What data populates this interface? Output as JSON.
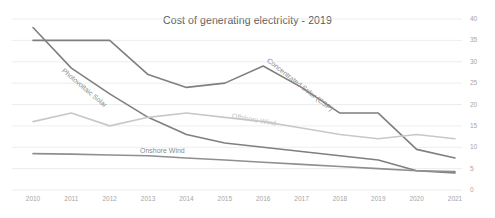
{
  "chart_data": {
    "type": "line",
    "title": "Cost of generating electricity - 2019",
    "xlabel": "",
    "ylabel": "",
    "ylim": [
      0,
      40
    ],
    "yticks": [
      0,
      5,
      10,
      15,
      20,
      25,
      30,
      35,
      40
    ],
    "grid": true,
    "legend_position": "inline-labels",
    "categories": [
      "2010",
      "2011",
      "2012",
      "2013",
      "2014",
      "2015",
      "2016",
      "2017",
      "2018",
      "2019",
      "2020",
      "2021"
    ],
    "series": [
      {
        "name": "Photovoltaic Solar",
        "color": "#7f7f7f",
        "values": [
          38.0,
          28.5,
          22.5,
          17.0,
          13.0,
          11.0,
          10.0,
          9.0,
          8.0,
          7.0,
          4.5,
          4.0
        ]
      },
      {
        "name": "Concentrated Solar (CSP)",
        "color": "#7f7f7f",
        "values": [
          35.0,
          35.0,
          35.0,
          27.0,
          24.0,
          25.0,
          29.0,
          24.0,
          18.0,
          18.0,
          9.5,
          7.5
        ]
      },
      {
        "name": "Offshore Wind",
        "color": "#c8c8c8",
        "values": [
          16.0,
          18.0,
          15.0,
          17.0,
          18.0,
          17.0,
          16.0,
          14.5,
          13.0,
          12.0,
          13.0,
          12.0
        ]
      },
      {
        "name": "Onshore Wind",
        "color": "#8f8f8f",
        "values": [
          8.5,
          8.4,
          8.2,
          8.0,
          7.5,
          7.0,
          6.5,
          6.0,
          5.5,
          5.0,
          4.5,
          4.3
        ]
      }
    ]
  },
  "axis": {
    "y_labels": [
      "40",
      "35",
      "30",
      "25",
      "20",
      "15",
      "10",
      "5",
      "0"
    ],
    "x_labels": [
      "2010",
      "2011",
      "2012",
      "2013",
      "2014",
      "2015",
      "2016",
      "2017",
      "2018",
      "2019",
      "2020",
      "2021"
    ]
  },
  "labels": {
    "photovoltaic_solar": "Photovoltaic Solar",
    "concentrated_solar": "Concentrated Solar (CSP)",
    "offshore_wind": "Offshore Wind",
    "onshore_wind": "Onshore Wind"
  },
  "colors": {
    "title": "#595959",
    "tick": "#a6a6a6",
    "grid": "#e8e8e8",
    "dark_line": "#7f7f7f",
    "mid_line": "#8f8f8f",
    "light_line": "#c8c8c8",
    "background": "#ffffff"
  }
}
